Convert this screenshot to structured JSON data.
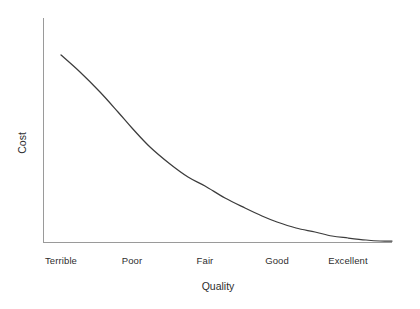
{
  "chart_data": {
    "type": "line",
    "title": "",
    "subtitle": "",
    "xlabel": "Quality",
    "ylabel": "Cost",
    "categories": [
      "Terrible",
      "Poor",
      "Fair",
      "Good",
      "Excellent"
    ],
    "series": [
      {
        "name": "Cost vs Quality",
        "values": [
          100,
          62,
          31,
          12,
          3
        ]
      }
    ],
    "x": [
      0,
      1,
      2,
      3,
      4
    ],
    "xlim": [
      -0.25,
      4.62
    ],
    "ylim": [
      0,
      112
    ],
    "grid": false,
    "legend": false,
    "legend_position": "none",
    "axis_ticks_shown": false,
    "y_tick_labels": [],
    "annotations": [],
    "colors": {
      "curve": "#3c3c3c",
      "axis": "#9a9a9a",
      "text": "#2e2e2e",
      "background": "#ffffff"
    },
    "geometry": {
      "axis_x": 43,
      "axis_y": 242,
      "axis_top": 18,
      "axis_right": 392,
      "curve_points": [
        [
          61,
          55
        ],
        [
          80,
          72
        ],
        [
          100,
          92
        ],
        [
          118,
          112
        ],
        [
          132,
          128
        ],
        [
          150,
          147
        ],
        [
          170,
          164
        ],
        [
          188,
          177
        ],
        [
          205,
          186
        ],
        [
          225,
          198
        ],
        [
          245,
          208
        ],
        [
          262,
          216
        ],
        [
          277,
          222
        ],
        [
          296,
          228
        ],
        [
          315,
          232
        ],
        [
          332,
          236
        ],
        [
          348,
          238
        ],
        [
          366,
          240
        ],
        [
          380,
          241
        ],
        [
          392,
          241
        ]
      ],
      "tick_positions_x": [
        61,
        132,
        205,
        277,
        348
      ],
      "tick_label_y": 255,
      "xlabel_x": 218,
      "xlabel_y": 280,
      "ylabel_x": 22,
      "ylabel_y": 143
    }
  }
}
